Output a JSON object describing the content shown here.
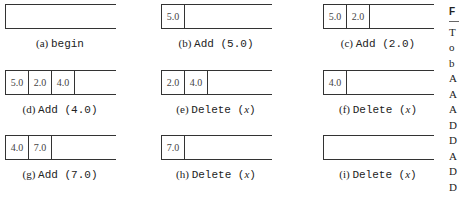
{
  "figure": {
    "panels": [
      {
        "label": "(a)",
        "op": "begin",
        "arg": "",
        "cells": []
      },
      {
        "label": "(b)",
        "op": "Add",
        "arg": "(5.0)",
        "cells": [
          "5.0"
        ]
      },
      {
        "label": "(c)",
        "op": "Add",
        "arg": "(2.0)",
        "cells": [
          "5.0",
          "2.0"
        ]
      },
      {
        "label": "(d)",
        "op": "Add",
        "arg": "(4.0)",
        "cells": [
          "5.0",
          "2.0",
          "4.0"
        ]
      },
      {
        "label": "(e)",
        "op": "Delete",
        "arg": "x",
        "cells": [
          "2.0",
          "4.0"
        ]
      },
      {
        "label": "(f)",
        "op": "Delete",
        "arg": "x",
        "cells": [
          "4.0"
        ]
      },
      {
        "label": "(g)",
        "op": "Add",
        "arg": "(7.0)",
        "cells": [
          "4.0",
          "7.0"
        ]
      },
      {
        "label": "(h)",
        "op": "Delete",
        "arg": "x",
        "cells": [
          "7.0"
        ]
      },
      {
        "label": "(i)",
        "op": "Delete",
        "arg": "x",
        "cells": []
      }
    ]
  },
  "side_text": {
    "heading": "F",
    "lines": [
      "T",
      "o",
      "b",
      "A",
      "A",
      "A",
      "D",
      "D",
      "A",
      "D",
      "D",
      "e"
    ]
  }
}
